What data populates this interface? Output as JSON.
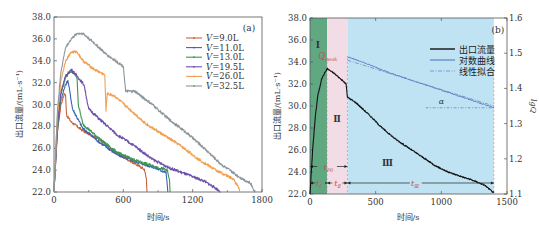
{
  "chart_data": [
    {
      "panel": "(a)",
      "type": "line",
      "title": "",
      "xlabel": "时间/s",
      "ylabel": "出口流量/(mL·s⁻¹)",
      "xlim": [
        0,
        1800
      ],
      "ylim": [
        22.0,
        38.0
      ],
      "xticks": [
        "0",
        "600",
        "1200",
        "1800"
      ],
      "yticks": [
        "22.0",
        "24.0",
        "26.0",
        "28.0",
        "30.0",
        "32.0",
        "34.0",
        "36.0",
        "38.0"
      ],
      "grid": false,
      "legend_position": "upper right",
      "series": [
        {
          "name": "V=9.0L",
          "color": "#c8643c",
          "points": [
            [
              0,
              22.0
            ],
            [
              30,
              27.5
            ],
            [
              60,
              30.0
            ],
            [
              90,
              31.0
            ],
            [
              100,
              30.8
            ],
            [
              110,
              29.0
            ],
            [
              150,
              28.4
            ],
            [
              250,
              27.6
            ],
            [
              400,
              26.8
            ],
            [
              500,
              25.8
            ],
            [
              600,
              25.2
            ],
            [
              700,
              24.6
            ],
            [
              780,
              24.1
            ],
            [
              800,
              23.2
            ],
            [
              805,
              22.0
            ]
          ]
        },
        {
          "name": "V=11.0L",
          "color": "#3c64b4",
          "points": [
            [
              0,
              22.0
            ],
            [
              30,
              27.8
            ],
            [
              60,
              30.5
            ],
            [
              100,
              31.8
            ],
            [
              120,
              32.2
            ],
            [
              140,
              31.0
            ],
            [
              160,
              29.6
            ],
            [
              250,
              27.8
            ],
            [
              400,
              26.5
            ],
            [
              550,
              25.4
            ],
            [
              700,
              24.8
            ],
            [
              850,
              24.3
            ],
            [
              970,
              23.8
            ],
            [
              985,
              22.0
            ]
          ]
        },
        {
          "name": "V=13.0L",
          "color": "#3c9650",
          "points": [
            [
              0,
              22.0
            ],
            [
              30,
              28.0
            ],
            [
              60,
              31.0
            ],
            [
              100,
              32.5
            ],
            [
              140,
              33.0
            ],
            [
              180,
              32.8
            ],
            [
              200,
              32.4
            ],
            [
              210,
              30.0
            ],
            [
              250,
              28.2
            ],
            [
              400,
              26.8
            ],
            [
              550,
              25.6
            ],
            [
              700,
              24.9
            ],
            [
              850,
              24.4
            ],
            [
              980,
              24.0
            ],
            [
              1000,
              23.0
            ],
            [
              1005,
              22.0
            ]
          ]
        },
        {
          "name": "V=19.5L",
          "color": "#6e50aa",
          "points": [
            [
              0,
              22.0
            ],
            [
              30,
              28.2
            ],
            [
              60,
              31.2
            ],
            [
              100,
              32.6
            ],
            [
              150,
              33.2
            ],
            [
              200,
              32.6
            ],
            [
              260,
              31.8
            ],
            [
              300,
              29.6
            ],
            [
              400,
              28.6
            ],
            [
              550,
              27.2
            ],
            [
              700,
              26.2
            ],
            [
              850,
              25.0
            ],
            [
              1000,
              24.2
            ],
            [
              1150,
              23.6
            ],
            [
              1300,
              23.0
            ],
            [
              1420,
              22.2
            ],
            [
              1440,
              22.0
            ]
          ]
        },
        {
          "name": "V=26.0L",
          "color": "#f0a050",
          "points": [
            [
              0,
              22.0
            ],
            [
              30,
              29.0
            ],
            [
              60,
              32.2
            ],
            [
              100,
              34.0
            ],
            [
              150,
              34.8
            ],
            [
              200,
              34.8
            ],
            [
              250,
              34.0
            ],
            [
              350,
              33.2
            ],
            [
              440,
              32.7
            ],
            [
              450,
              29.4
            ],
            [
              460,
              31.0
            ],
            [
              520,
              30.8
            ],
            [
              650,
              29.6
            ],
            [
              800,
              28.2
            ],
            [
              950,
              27.2
            ],
            [
              1100,
              26.2
            ],
            [
              1250,
              25.0
            ],
            [
              1400,
              24.0
            ],
            [
              1550,
              23.2
            ],
            [
              1600,
              22.4
            ],
            [
              1610,
              22.0
            ]
          ]
        },
        {
          "name": "V=32.5L",
          "color": "#8c969b",
          "points": [
            [
              0,
              22.0
            ],
            [
              30,
              29.5
            ],
            [
              60,
              33.0
            ],
            [
              100,
              35.2
            ],
            [
              150,
              36.0
            ],
            [
              200,
              36.5
            ],
            [
              250,
              36.5
            ],
            [
              350,
              35.6
            ],
            [
              450,
              34.6
            ],
            [
              600,
              33.5
            ],
            [
              620,
              31.2
            ],
            [
              700,
              31.2
            ],
            [
              850,
              30.0
            ],
            [
              1000,
              28.6
            ],
            [
              1150,
              27.4
            ],
            [
              1300,
              26.0
            ],
            [
              1450,
              24.5
            ],
            [
              1600,
              23.4
            ],
            [
              1700,
              22.8
            ],
            [
              1740,
              22.0
            ]
          ]
        }
      ],
      "annotations": [
        "(a)"
      ]
    },
    {
      "panel": "(b)",
      "type": "line",
      "title": "",
      "xlabel": "时间/s",
      "ylabel": "出口流量/(mL·s⁻¹)",
      "ylabel_right": "lgQ",
      "xlim": [
        0,
        1500
      ],
      "ylim": [
        22.0,
        38.0
      ],
      "ylim_right": [
        1.1,
        1.6
      ],
      "xticks": [
        "0",
        "500",
        "1000",
        "1500"
      ],
      "yticks": [
        "22.0",
        "24.0",
        "26.0",
        "28.0",
        "30.0",
        "32.0",
        "34.0",
        "36.0",
        "38.0"
      ],
      "yticks_right": [
        "1.1",
        "1.2",
        "1.3",
        "1.4",
        "1.5",
        "1.6"
      ],
      "grid": false,
      "legend_position": "upper right",
      "regions": [
        {
          "label": "Ⅰ",
          "x": [
            0,
            130
          ],
          "color": "#5fa882"
        },
        {
          "label": "Ⅱ",
          "x": [
            130,
            285
          ],
          "color": "#f2dce6"
        },
        {
          "label": "Ⅲ",
          "x": [
            285,
            1400
          ],
          "color": "#bfe3f2"
        }
      ],
      "series": [
        {
          "name": "出口流量",
          "color": "#111111",
          "axis": "left",
          "points": [
            [
              0,
              22.0
            ],
            [
              20,
              26.0
            ],
            [
              40,
              29.0
            ],
            [
              60,
              31.0
            ],
            [
              90,
              32.5
            ],
            [
              130,
              33.4
            ],
            [
              180,
              33.0
            ],
            [
              230,
              32.5
            ],
            [
              275,
              32.0
            ],
            [
              285,
              30.8
            ],
            [
              350,
              30.3
            ],
            [
              450,
              29.2
            ],
            [
              550,
              28.0
            ],
            [
              650,
              27.0
            ],
            [
              750,
              26.2
            ],
            [
              850,
              25.4
            ],
            [
              950,
              24.6
            ],
            [
              1050,
              24.0
            ],
            [
              1150,
              23.6
            ],
            [
              1250,
              23.2
            ],
            [
              1330,
              22.8
            ],
            [
              1400,
              22.1
            ]
          ]
        },
        {
          "name": "对数曲线",
          "color": "#4a6fc4",
          "axis": "right",
          "points": [
            [
              285,
              1.49
            ],
            [
              400,
              1.475
            ],
            [
              600,
              1.445
            ],
            [
              800,
              1.42
            ],
            [
              1000,
              1.395
            ],
            [
              1200,
              1.37
            ],
            [
              1400,
              1.345
            ]
          ]
        },
        {
          "name": "线性拟合",
          "color": "#7a8cc8",
          "axis": "right",
          "style": "dash-dot",
          "points": [
            [
              285,
              1.48
            ],
            [
              1400,
              1.35
            ]
          ]
        }
      ],
      "annotations": [
        {
          "text": "(b)"
        },
        {
          "text": "Q_peak",
          "x": 130,
          "y": 34.2
        },
        {
          "text": "t_P0",
          "desc": "arrow spanning stages I and II"
        },
        {
          "text": "t_I",
          "desc": "duration of stage I"
        },
        {
          "text": "t_II",
          "desc": "duration of stage II"
        },
        {
          "text": "t_III",
          "desc": "duration of stage III"
        },
        {
          "text": "α",
          "desc": "angle of linear fit"
        }
      ]
    }
  ],
  "panelA": {
    "tag": "(a)",
    "xlabel": "时间/s",
    "ylabel": "出口流量/(mL·s⁻¹)",
    "legend": [
      "V=9.0L",
      "V=11.0L",
      "V=13.0L",
      "V=19.5L",
      "V=26.0L",
      "V=32.5L"
    ]
  },
  "panelB": {
    "tag": "(b)",
    "xlabel": "时间/s",
    "ylabel": "出口流量/(mL·s⁻¹)",
    "ylabel_right": "lgQ",
    "legend": [
      "出口流量",
      "对数曲线",
      "线性拟合"
    ],
    "region_labels": [
      "Ⅰ",
      "Ⅱ",
      "Ⅲ"
    ],
    "qpeak": "Q",
    "qpeak_sub": "peak",
    "alpha": "α",
    "t_p0": "t",
    "t_p0_sub": "P0",
    "t_1": "t",
    "t_1_sub": "Ⅰ",
    "t_2": "t",
    "t_2_sub": "Ⅱ",
    "t_3": "t",
    "t_3_sub": "Ⅲ"
  }
}
